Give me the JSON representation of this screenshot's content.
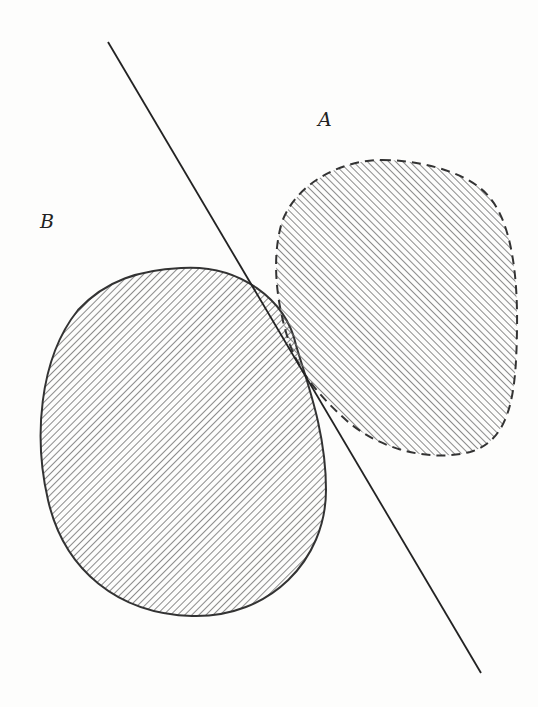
{
  "figure": {
    "labels": {
      "set_a": "A",
      "set_b": "B"
    },
    "separating_line": {
      "x1": 108,
      "y1": 42,
      "x2": 481,
      "y2": 673,
      "stroke": "#222222"
    },
    "set_a": {
      "outline": "dashed",
      "hatch": "diagonal-rising",
      "stroke": "#333333"
    },
    "set_b": {
      "outline": "solid",
      "hatch": "diagonal-falling",
      "stroke": "#333333"
    },
    "hatch_color": "#6e6e6e",
    "background": "#fdfdfc"
  }
}
